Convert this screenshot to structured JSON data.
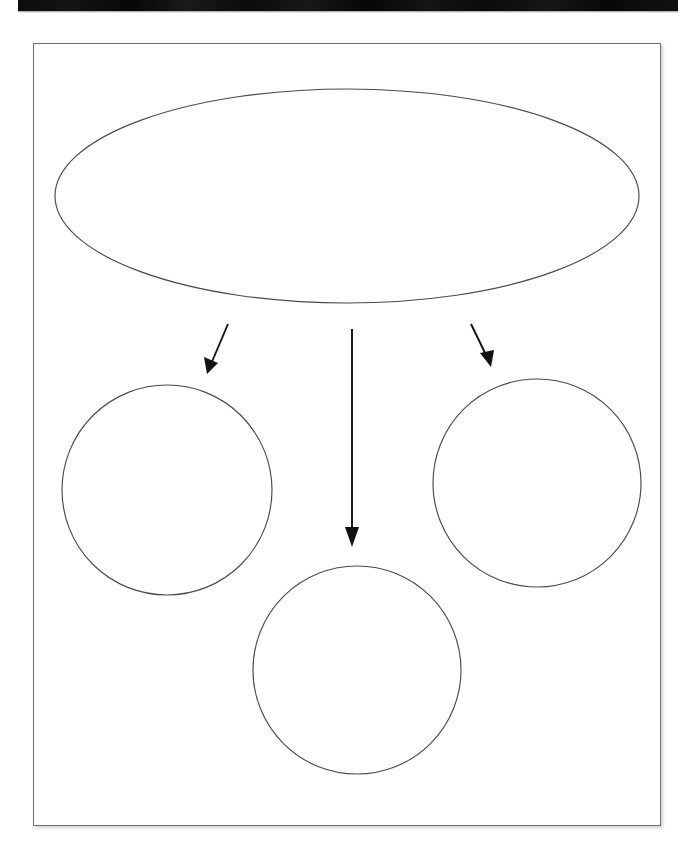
{
  "document": {
    "type": "graphic-organizer-worksheet",
    "orientation": "portrait",
    "background_color": "#ffffff",
    "outline_color": "#4a4a4a",
    "connector_color": "#111111",
    "scan_bar_color": "#0a0a0a",
    "page_border_color": "#6f6f6f"
  },
  "scan_bar": {
    "label": ""
  },
  "sheet": {
    "label": ""
  },
  "main_shape": {
    "name": "main-topic-ellipse",
    "shape": "ellipse",
    "text": "",
    "cx": 347,
    "cy": 196,
    "rx": 292,
    "ry": 107
  },
  "detail_shapes": [
    {
      "name": "detail-circle-left",
      "shape": "circle",
      "text": "",
      "cx": 167,
      "cy": 490,
      "r": 105
    },
    {
      "name": "detail-circle-bottom",
      "shape": "circle",
      "text": "",
      "cx": 357,
      "cy": 670,
      "r": 104
    },
    {
      "name": "detail-circle-right",
      "shape": "circle",
      "text": "",
      "cx": 537,
      "cy": 483,
      "r": 104
    }
  ],
  "connectors": [
    {
      "name": "connector-arrow-left",
      "direction": "down-left",
      "from": {
        "x": 228,
        "y": 324
      },
      "to": {
        "x": 207,
        "y": 373
      },
      "label": ""
    },
    {
      "name": "connector-arrow-center",
      "direction": "down",
      "from": {
        "x": 352,
        "y": 329
      },
      "to": {
        "x": 352,
        "y": 546
      },
      "label": ""
    },
    {
      "name": "connector-arrow-right",
      "direction": "down-right",
      "from": {
        "x": 471,
        "y": 324
      },
      "to": {
        "x": 491,
        "y": 366
      },
      "label": ""
    }
  ]
}
